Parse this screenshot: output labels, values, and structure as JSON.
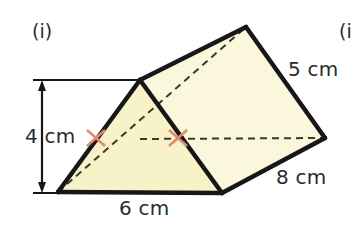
{
  "figure": {
    "part_label": "(i)",
    "next_part_label": "(i",
    "shape": "triangular-prism",
    "colors": {
      "face_fill": "#f7f2c8",
      "face_fill_light": "#faf7dc",
      "edge": "#171717",
      "hidden_edge": "#3a3a28",
      "tick": "#e08a72",
      "dimension_line": "#171717",
      "text": "#2b2b2b",
      "background": "#ffffff"
    },
    "dimensions": [
      {
        "name": "height",
        "value": "4 cm",
        "orientation": "vertical-left"
      },
      {
        "name": "base",
        "value": "6 cm",
        "orientation": "horizontal-bottom"
      },
      {
        "name": "slant",
        "value": "5 cm",
        "orientation": "diagonal-right-upper"
      },
      {
        "name": "length",
        "value": "8 cm",
        "orientation": "diagonal-right-lower"
      }
    ],
    "dimension_values": {
      "height": "4 cm",
      "base": "6 cm",
      "slant": "5 cm",
      "length": "8 cm"
    },
    "tick_marks": {
      "count": 2,
      "meaning": "equal-length-edges"
    }
  }
}
